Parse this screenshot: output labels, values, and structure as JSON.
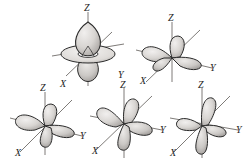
{
  "figure": {
    "background_color": "#ffffff",
    "line_color": "#2b2b2b",
    "lobe_fill_light": "#e2e0de",
    "lobe_fill_mid": "#c9c6c3",
    "lobe_fill_dark": "#a9a5a2",
    "axis_line_color": "#6f6c69",
    "label_color": "#1d1d1d"
  },
  "orbitals": [
    {
      "id": "dz2",
      "name": "d-z-squared-orbital",
      "description": "two lobes along Z axis with a torus ring in the XY plane",
      "lobe_count": 2,
      "has_torus": true,
      "axes": [
        {
          "key": "z",
          "label": "Z"
        },
        {
          "key": "x",
          "label": "X"
        },
        {
          "key": "y",
          "label": "Y"
        }
      ]
    },
    {
      "id": "dxy-top",
      "name": "d-xy-orbital-top",
      "description": "four cloverleaf lobes lying in the XY plane",
      "lobe_count": 4,
      "has_torus": false,
      "axes": [
        {
          "key": "z",
          "label": "Z"
        },
        {
          "key": "x",
          "label": "X"
        },
        {
          "key": "y",
          "label": "Y"
        }
      ]
    },
    {
      "id": "dx2y2",
      "name": "d-x2-y2-orbital",
      "description": "four cloverleaf lobes along the X and Y axes",
      "lobe_count": 4,
      "has_torus": false,
      "axes": [
        {
          "key": "z",
          "label": "Z"
        },
        {
          "key": "x",
          "label": "X"
        },
        {
          "key": "y",
          "label": "Y"
        }
      ]
    },
    {
      "id": "dyz",
      "name": "d-yz-orbital",
      "description": "four cloverleaf lobes between the Y and Z axes",
      "lobe_count": 4,
      "has_torus": false,
      "axes": [
        {
          "key": "z",
          "label": "Z"
        },
        {
          "key": "x",
          "label": "X"
        },
        {
          "key": "y",
          "label": "Y"
        }
      ]
    },
    {
      "id": "dxz",
      "name": "d-xz-orbital",
      "description": "four cloverleaf lobes between the X and Z axes",
      "lobe_count": 4,
      "has_torus": false,
      "axes": [
        {
          "key": "z",
          "label": "Z"
        },
        {
          "key": "x",
          "label": "X"
        },
        {
          "key": "y",
          "label": "Y"
        }
      ]
    }
  ]
}
